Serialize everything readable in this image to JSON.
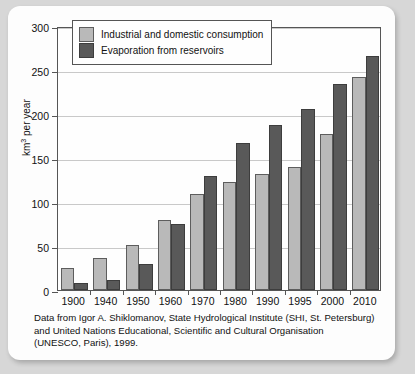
{
  "chart_data": {
    "type": "bar",
    "title": "",
    "xlabel": "",
    "ylabel": "km3 per year",
    "ylabel_parts": {
      "base": "km",
      "sup": "3",
      "tail": " per year"
    },
    "ylim": [
      0,
      300
    ],
    "yticks": [
      0,
      50,
      100,
      150,
      200,
      250,
      300
    ],
    "grid": true,
    "legend_position": "top-left-inside",
    "categories": [
      "1900",
      "1940",
      "1950",
      "1960",
      "1970",
      "1980",
      "1990",
      "1995",
      "2000",
      "2010"
    ],
    "series": [
      {
        "name": "Industrial and domestic consumption",
        "color": "#b9b9b9",
        "values": [
          25,
          36,
          51,
          79,
          109,
          123,
          132,
          140,
          177,
          242
        ]
      },
      {
        "name": "Evaporation from reservoirs",
        "color": "#595959",
        "values": [
          8,
          11,
          30,
          75,
          130,
          167,
          188,
          206,
          234,
          266
        ]
      }
    ]
  },
  "legend": {
    "items": [
      {
        "label": "Industrial and domestic consumption"
      },
      {
        "label": "Evaporation from reservoirs"
      }
    ]
  },
  "caption": {
    "line1": "Data from Igor A. Shiklomanov, State Hydrological Institute (SHI, St. Petersburg)",
    "line2": "and United Nations Educational, Scientific and Cultural Organisation",
    "line3": "(UNESCO, Paris), 1999."
  },
  "colors": {
    "light_bar": "#b9b9b9",
    "dark_bar": "#595959",
    "axis": "#555555",
    "grid": "#c9c9c9",
    "panel_background": "#fdfdfd",
    "page_background": "#d7d7d7"
  }
}
